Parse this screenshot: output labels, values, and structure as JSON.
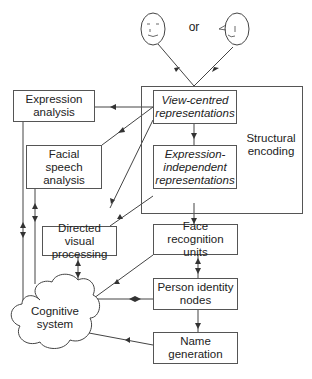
{
  "diagram": {
    "title": "",
    "top": {
      "or_label": "or",
      "faces": [
        "front-face",
        "profile-face"
      ]
    },
    "structural_encoding": {
      "label": "Structural encoding",
      "line1": "Structural",
      "line2": "encoding",
      "view_centred": {
        "line1": "View-centred",
        "line2": "representations"
      },
      "expression_independent": {
        "line1": "Expression-",
        "line2": "independent",
        "line3": "representations"
      }
    },
    "nodes": {
      "expression_analysis": {
        "line1": "Expression",
        "line2": "analysis"
      },
      "facial_speech_analysis": {
        "line1": "Facial",
        "line2": "speech",
        "line3": "analysis"
      },
      "directed_visual_processing": {
        "line1": "Directed visual",
        "line2": "processing"
      },
      "face_recognition_units": {
        "line1": "Face recognition",
        "line2": "units"
      },
      "person_identity_nodes": {
        "line1": "Person identity",
        "line2": "nodes"
      },
      "name_generation": {
        "line1": "Name",
        "line2": "generation"
      },
      "cognitive_system": {
        "line1": "Cognitive",
        "line2": "system"
      }
    },
    "colors": {
      "line": "#444444",
      "box_border": "#555555",
      "background": "#ffffff"
    }
  }
}
